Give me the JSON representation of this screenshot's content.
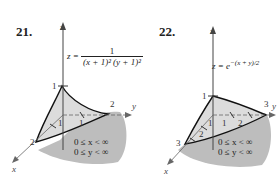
{
  "figures": [
    {
      "number": "21.",
      "equation": {
        "lhs": "z =",
        "numerator": "1",
        "denominator": "(x + 1)² (y + 1)²"
      },
      "axis_labels": {
        "x": "x",
        "y": "y",
        "z": "z"
      },
      "ticks": {
        "z_top": "1",
        "y_end": "2",
        "x_end": "2",
        "x_tick": "1",
        "y_tick": "1"
      },
      "domain": [
        "0 ≤ x < ∞",
        "0 ≤ y < ∞"
      ]
    },
    {
      "number": "22.",
      "equation": {
        "lhs": "z =",
        "base": "e",
        "exponent": "−(x + y)/2"
      },
      "axis_labels": {
        "x": "x",
        "y": "y",
        "z": "z"
      },
      "ticks": {
        "z_top": "1",
        "y_end": "3",
        "x_end": "3",
        "x_tick1": "1",
        "x_tick2": "2",
        "y_tick1": "1",
        "y_tick2": "2"
      },
      "domain": [
        "0 ≤ x < ∞",
        "0 ≤ y < ∞"
      ]
    }
  ],
  "colors": {
    "shadow": "#bdbdbd",
    "surface": "#dcdcdc",
    "ink": "#222222"
  }
}
